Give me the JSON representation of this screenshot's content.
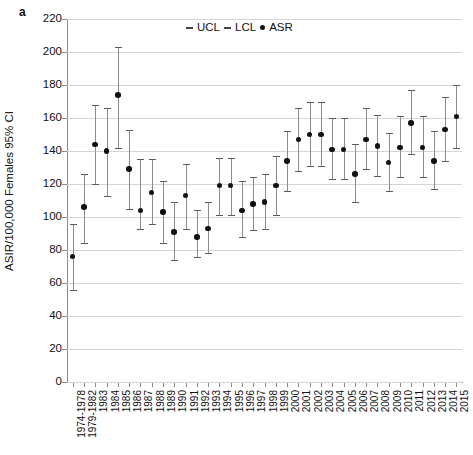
{
  "panel": {
    "label": "a"
  },
  "legend": {
    "position": "top-center",
    "entries": [
      {
        "key": "ucl",
        "marker": "dash",
        "label": "UCL"
      },
      {
        "key": "lcl",
        "marker": "dash",
        "label": "LCL"
      },
      {
        "key": "asr",
        "marker": "dot",
        "label": "ASR"
      }
    ]
  },
  "chart_data": {
    "type": "scatter",
    "title": "",
    "subtitle": "",
    "xlabel": "",
    "ylabel": "ASIR/100,000 Females 95% CI",
    "ylim": [
      0,
      220
    ],
    "yticks": [
      0,
      20,
      40,
      60,
      80,
      100,
      120,
      140,
      160,
      180,
      200,
      220
    ],
    "ytick_labels": [
      "0",
      "20",
      "40",
      "60",
      "80",
      "100",
      "120",
      "140",
      "160",
      "180",
      "200",
      "220"
    ],
    "grid": true,
    "grid_axis": "y",
    "legend_entries": [
      "UCL",
      "LCL",
      "ASR"
    ],
    "point_color": "#111111",
    "errorbar_color": "#8c8c8c",
    "gridline_color": "#d4d4d4",
    "categories": [
      "1974-1978",
      "1979-1982",
      "1983",
      "1984",
      "1985",
      "1986",
      "1987",
      "1988",
      "1989",
      "1990",
      "1991",
      "1992",
      "1993",
      "1994",
      "1995",
      "1996",
      "1997",
      "1998",
      "1999",
      "2000",
      "2001",
      "2002",
      "2003",
      "2004",
      "2005",
      "2006",
      "2007",
      "2008",
      "2009",
      "2010",
      "2011",
      "2012",
      "2013",
      "2014",
      "2015"
    ],
    "series": [
      {
        "name": "ASR",
        "values": [
          76,
          106,
          144,
          140,
          174,
          129,
          104,
          115,
          103,
          91,
          113,
          88,
          93,
          119,
          119,
          104,
          108,
          109,
          119,
          134,
          147,
          150,
          150,
          141,
          141,
          126,
          147,
          143,
          133,
          142,
          157,
          142,
          134,
          153,
          161
        ]
      },
      {
        "name": "LCL",
        "values": [
          56,
          84,
          120,
          113,
          142,
          105,
          93,
          96,
          84,
          74,
          93,
          76,
          78,
          101,
          101,
          88,
          92,
          93,
          101,
          116,
          128,
          131,
          131,
          123,
          123,
          109,
          129,
          125,
          116,
          124,
          138,
          124,
          117,
          134,
          142
        ]
      },
      {
        "name": "UCL",
        "values": [
          96,
          126,
          168,
          166,
          203,
          153,
          135,
          135,
          122,
          109,
          132,
          104,
          109,
          136,
          136,
          122,
          124,
          126,
          137,
          152,
          166,
          170,
          170,
          160,
          160,
          144,
          166,
          162,
          151,
          161,
          177,
          161,
          152,
          173,
          180
        ]
      }
    ]
  }
}
